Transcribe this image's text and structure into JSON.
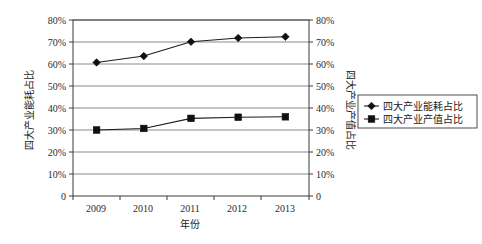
{
  "chart_data": {
    "type": "line",
    "title": "",
    "xlabel": "年份",
    "ylabel": "四大产业能耗占比",
    "y2label": "四大产业产值占比",
    "categories": [
      "2009",
      "2010",
      "2011",
      "2012",
      "2013"
    ],
    "ylim": [
      0,
      80
    ],
    "y2lim": [
      0,
      80
    ],
    "yticks": [
      "0",
      "10%",
      "20%",
      "30%",
      "40%",
      "50%",
      "60%",
      "70%",
      "80%"
    ],
    "ytick_values": [
      0,
      10,
      20,
      30,
      40,
      50,
      60,
      70,
      80
    ],
    "y2ticks": [
      "0",
      "10%",
      "20%",
      "30%",
      "40%",
      "50%",
      "60%",
      "70%",
      "80%"
    ],
    "grid": true,
    "grid_axis": "y",
    "legend_position": "right",
    "series": [
      {
        "name": "四大产业能耗占比",
        "marker": "diamond",
        "axis": "left",
        "values": [
          60.7,
          63.6,
          70.1,
          71.8,
          72.4
        ]
      },
      {
        "name": "四大产业产值占比",
        "marker": "square",
        "axis": "right",
        "values": [
          30.0,
          30.7,
          35.3,
          35.8,
          36.0
        ]
      }
    ],
    "colors": {
      "line": "#1c1c1c",
      "marker": "#101010",
      "grid": "#5a5a5a",
      "frame": "#3a3a3a",
      "background": "#ffffff"
    }
  },
  "legend": {
    "entries": [
      {
        "label": "四大产业能耗占比",
        "marker": "diamond"
      },
      {
        "label": "四大产业产值占比",
        "marker": "square"
      }
    ]
  },
  "axes": {
    "left": {
      "title": "四大产业能耗占比",
      "ticks": [
        "80%",
        "70%",
        "60%",
        "50%",
        "40%",
        "30%",
        "20%",
        "10%",
        "0"
      ]
    },
    "right": {
      "title": "四大产业产值占比",
      "ticks": [
        "80%",
        "70%",
        "60%",
        "50%",
        "40%",
        "30%",
        "20%",
        "10%",
        "0"
      ]
    },
    "bottom": {
      "title": "年份",
      "ticks": [
        "2009",
        "2010",
        "2011",
        "2012",
        "2013"
      ]
    }
  }
}
